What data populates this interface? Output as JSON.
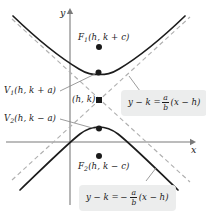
{
  "figure": {
    "width": 206,
    "height": 215,
    "background_color": "#ffffff"
  },
  "axes": {
    "x_label": "x",
    "y_label": "y",
    "color": "#6f6f6f",
    "origin_px": {
      "x": 70,
      "y": 142
    }
  },
  "curve": {
    "color": "#1a1a1a",
    "style": "solid",
    "description": "two branches opening up and down"
  },
  "asymptotes": {
    "color": "#a8a8a8",
    "style": "dashed"
  },
  "points": [
    {
      "name": "focus-1",
      "label_main": "F",
      "label_sub": "1",
      "label_rest": "(h, k + c)",
      "cx": 99,
      "cy": 47
    },
    {
      "name": "vertex-1",
      "label_main": "V",
      "label_sub": "1",
      "label_rest": "(h, k + a)",
      "cx": 98,
      "cy": 72
    },
    {
      "name": "center",
      "label_main": "",
      "label_sub": "",
      "label_rest": "(h, k)",
      "cx": 99,
      "cy": 100
    },
    {
      "name": "vertex-2",
      "label_main": "V",
      "label_sub": "2",
      "label_rest": "(h, k − a)",
      "cx": 99,
      "cy": 129
    },
    {
      "name": "focus-2",
      "label_main": "F",
      "label_sub": "2",
      "label_rest": "(h, k − c)",
      "cx": 99,
      "cy": 156
    }
  ],
  "labels": {
    "focus_1": {
      "main": "F",
      "sub": "1",
      "rest": "(h, k + c)"
    },
    "vertex_1": {
      "main": "V",
      "sub": "1",
      "rest": "(h, k + a)"
    },
    "center": {
      "text": "(h, k)"
    },
    "vertex_2": {
      "main": "V",
      "sub": "2",
      "rest": "(h, k − a)"
    },
    "focus_2": {
      "main": "F",
      "sub": "2",
      "rest": "(h, k − c)"
    }
  },
  "equations": {
    "upper": {
      "lhs": "y − k =",
      "sign": "",
      "numerator": "a",
      "denominator": "b",
      "rhs": "(x − h)",
      "box_color": "#eceded"
    },
    "lower": {
      "lhs": "y − k =",
      "sign": "−",
      "numerator": "a",
      "denominator": "b",
      "rhs": "(x − h)",
      "box_color": "#eceded"
    }
  }
}
